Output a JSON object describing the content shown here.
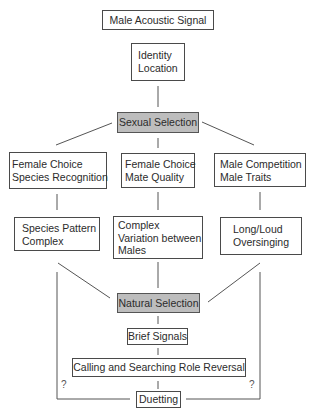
{
  "diagram": {
    "type": "flowchart",
    "nodes": {
      "signal": {
        "label": "Male Acoustic Signal"
      },
      "identity": {
        "lines": [
          "Identity",
          "Location"
        ]
      },
      "sexual_selection": {
        "label": "Sexual Selection",
        "fill": "#bdbdbd"
      },
      "female_choice_species": {
        "lines": [
          "Female Choice",
          "Species Recognition"
        ]
      },
      "female_choice_mate": {
        "lines": [
          "Female Choice",
          "Mate Quality"
        ]
      },
      "male_competition": {
        "lines": [
          "Male Competition",
          "Male Traits"
        ]
      },
      "species_pattern": {
        "lines": [
          "Species Pattern",
          "Complex"
        ]
      },
      "complex_variation": {
        "lines": [
          "Complex",
          "Variation between",
          "Males"
        ]
      },
      "long_loud": {
        "lines": [
          "Long/Loud",
          "Oversinging"
        ]
      },
      "natural_selection": {
        "label": "Natural Selection",
        "fill": "#bdbdbd"
      },
      "brief_signals": {
        "label": "Brief Signals"
      },
      "role_reversal": {
        "label": "Calling and Searching Role Reversal"
      },
      "duetting": {
        "label": "Duetting"
      }
    },
    "edges": [
      {
        "from": "signal",
        "to": "identity"
      },
      {
        "from": "identity",
        "to": "sexual_selection"
      },
      {
        "from": "sexual_selection",
        "to": "female_choice_species"
      },
      {
        "from": "sexual_selection",
        "to": "female_choice_mate"
      },
      {
        "from": "sexual_selection",
        "to": "male_competition"
      },
      {
        "from": "female_choice_species",
        "to": "species_pattern"
      },
      {
        "from": "female_choice_mate",
        "to": "complex_variation"
      },
      {
        "from": "male_competition",
        "to": "long_loud"
      },
      {
        "from": "species_pattern",
        "to": "natural_selection"
      },
      {
        "from": "complex_variation",
        "to": "natural_selection"
      },
      {
        "from": "long_loud",
        "to": "natural_selection"
      },
      {
        "from": "natural_selection",
        "to": "brief_signals"
      },
      {
        "from": "brief_signals",
        "to": "role_reversal"
      },
      {
        "from": "role_reversal",
        "to": "duetting"
      },
      {
        "from": "species_pattern",
        "to": "duetting",
        "label": "?"
      },
      {
        "from": "long_loud",
        "to": "duetting",
        "label": "?"
      }
    ],
    "uncertain_labels": {
      "left": "?",
      "right": "?"
    },
    "colors": {
      "stroke": "#4a4a4a",
      "shaded_fill": "#bdbdbd"
    }
  }
}
